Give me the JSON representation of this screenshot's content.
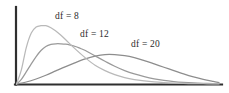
{
  "figure": {
    "background_color": "#ffffff",
    "axis_color": "#2f2f2f"
  },
  "chart_data": {
    "type": "line",
    "title": "",
    "subtitle": "",
    "xlabel": "",
    "ylabel": "",
    "grid": false,
    "legend_position": "inline-annotations",
    "xlim": [
      0,
      1
    ],
    "ylim": [
      0,
      1
    ],
    "axes": {
      "x_axis_visible": true,
      "y_axis_visible": true,
      "x_tick_labels": [],
      "y_tick_labels": []
    },
    "series": [
      {
        "name": "df = 8",
        "df": 8,
        "color": "#b9b9b9",
        "peak_x": 0.145,
        "peak_y": 0.87,
        "x": [
          0.0,
          0.024,
          0.048,
          0.073,
          0.097,
          0.121,
          0.145,
          0.17,
          0.194,
          0.218,
          0.243,
          0.291,
          0.34,
          0.388,
          0.437,
          0.485,
          0.534,
          0.582,
          0.631,
          0.68,
          0.728,
          0.777,
          0.825,
          0.874,
          0.922,
          0.971,
          1.0
        ],
        "y": [
          0.0,
          0.21,
          0.54,
          0.76,
          0.85,
          0.87,
          0.87,
          0.84,
          0.79,
          0.73,
          0.66,
          0.52,
          0.39,
          0.28,
          0.2,
          0.14,
          0.095,
          0.065,
          0.045,
          0.03,
          0.02,
          0.013,
          0.009,
          0.006,
          0.004,
          0.002,
          0.001
        ]
      },
      {
        "name": "df = 12",
        "df": 12,
        "color": "#9a9a9a",
        "peak_x": 0.25,
        "peak_y": 0.6,
        "x": [
          0.0,
          0.024,
          0.048,
          0.073,
          0.097,
          0.121,
          0.145,
          0.17,
          0.194,
          0.218,
          0.243,
          0.267,
          0.291,
          0.316,
          0.34,
          0.388,
          0.437,
          0.485,
          0.534,
          0.582,
          0.631,
          0.68,
          0.728,
          0.777,
          0.825,
          0.874,
          0.922,
          0.971,
          1.0
        ],
        "y": [
          0.0,
          0.07,
          0.18,
          0.3,
          0.41,
          0.5,
          0.56,
          0.59,
          0.6,
          0.6,
          0.595,
          0.58,
          0.56,
          0.53,
          0.5,
          0.42,
          0.34,
          0.265,
          0.2,
          0.15,
          0.11,
          0.078,
          0.054,
          0.037,
          0.025,
          0.016,
          0.01,
          0.006,
          0.004
        ]
      },
      {
        "name": "df = 20",
        "df": 20,
        "color": "#8d8d8d",
        "peak_x": 0.44,
        "peak_y": 0.44,
        "x": [
          0.0,
          0.048,
          0.097,
          0.145,
          0.194,
          0.243,
          0.291,
          0.34,
          0.388,
          0.437,
          0.485,
          0.534,
          0.582,
          0.631,
          0.68,
          0.728,
          0.777,
          0.825,
          0.874,
          0.922,
          0.971,
          1.0
        ],
        "y": [
          0.0,
          0.03,
          0.075,
          0.13,
          0.195,
          0.26,
          0.32,
          0.375,
          0.415,
          0.44,
          0.44,
          0.425,
          0.395,
          0.35,
          0.3,
          0.25,
          0.2,
          0.15,
          0.105,
          0.068,
          0.038,
          0.022
        ]
      }
    ],
    "annotations": [
      {
        "id": "label-df8",
        "text": "df = 8",
        "x": 55,
        "y": 11
      },
      {
        "id": "label-df12",
        "text": "df = 12",
        "x": 80,
        "y": 29
      },
      {
        "id": "label-df20",
        "text": "df = 20",
        "x": 131,
        "y": 39
      }
    ]
  }
}
